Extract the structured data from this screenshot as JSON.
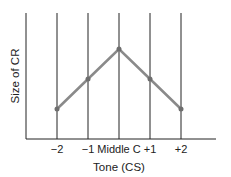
{
  "chart_data": {
    "type": "line",
    "title": "",
    "xlabel": "Tone (CS)",
    "ylabel": "Size of CR",
    "categories": [
      "-2",
      "-1",
      "Middle C",
      "+1",
      "+2"
    ],
    "tick_labels": [
      "−2",
      "−1",
      "Middle C",
      "+1",
      "+2"
    ],
    "series": [
      {
        "name": "Size of CR",
        "values": [
          1,
          2,
          3,
          2,
          1
        ]
      }
    ],
    "ylim": [
      0,
      4.2
    ],
    "y_ticks_shown": false,
    "grid": "vertical lines at each tone",
    "legend": "none",
    "colors": {
      "line": "#8a8a8a",
      "point": "#6e6e6e",
      "axes": "#222222"
    }
  }
}
